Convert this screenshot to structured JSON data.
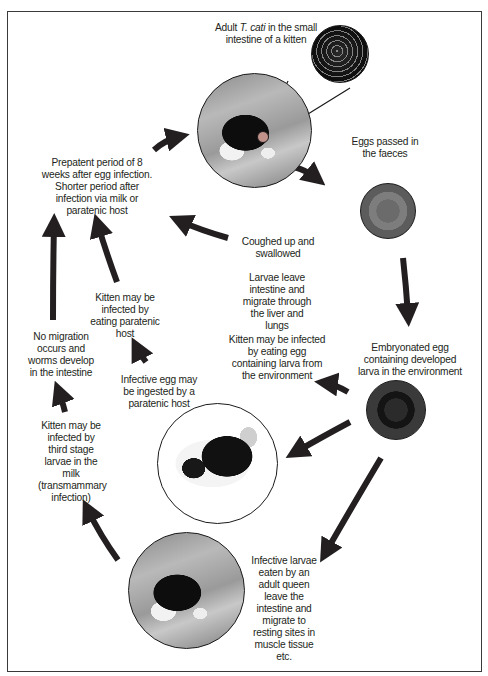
{
  "diagram": {
    "frame_color": "#3a3a3a",
    "arrow_color": "#231f20",
    "nodes": {
      "adult_worm": {
        "label_pre": "Adult ",
        "label_italic": "T. cati",
        "label_post": " in the small intestine of a kitten",
        "image": "kitten-photo",
        "inset_image": "worms-photo"
      },
      "eggs_passed": {
        "label": "Eggs passed in the faeces",
        "image": "egg-photo"
      },
      "coughed": {
        "label": "Coughed up and swallowed"
      },
      "larvae_migrate": {
        "label": "Larvae leave intestine and migrate through the liver and lungs"
      },
      "kitten_egg": {
        "label": "Kitten may be infected by eating egg containing larva from the environment"
      },
      "embryonated": {
        "label": "Embryonated egg containing developed larva in the environment",
        "image": "embryonated-egg-photo"
      },
      "prepatent": {
        "label": "Prepatent period of 8 weeks after egg infection. Shorter period after infection via milk or paratenic host"
      },
      "kitten_paratenic": {
        "label": "Kitten may be infected by eating paratenic host"
      },
      "no_migration": {
        "label": "No migration occurs and worms develop in the intestine"
      },
      "paratenic_ingest": {
        "label": "Infective egg may be ingested by a paratenic host",
        "image": "mouse-photo"
      },
      "transmammary": {
        "label": "Kitten may be infected by third stage larvae in the milk (transmammary infection)"
      },
      "queen": {
        "label": "Infective larvae eaten by an adult queen leave the intestine and migrate to resting sites in muscle tissue etc.",
        "image": "adult-cat-photo"
      }
    },
    "edges": [
      {
        "from": "prepatent",
        "to": "adult_worm"
      },
      {
        "from": "adult_worm",
        "to": "eggs_passed"
      },
      {
        "from": "eggs_passed",
        "to": "embryonated"
      },
      {
        "from": "embryonated",
        "to": "kitten_egg"
      },
      {
        "from": "embryonated",
        "to": "paratenic_ingest"
      },
      {
        "from": "embryonated",
        "to": "queen"
      },
      {
        "from": "coughed",
        "to": "prepatent"
      },
      {
        "from": "paratenic_ingest",
        "to": "kitten_paratenic"
      },
      {
        "from": "kitten_paratenic",
        "to": "prepatent"
      },
      {
        "from": "no_migration",
        "to": "prepatent"
      },
      {
        "from": "transmammary",
        "to": "no_migration"
      },
      {
        "from": "queen",
        "to": "transmammary"
      }
    ]
  }
}
